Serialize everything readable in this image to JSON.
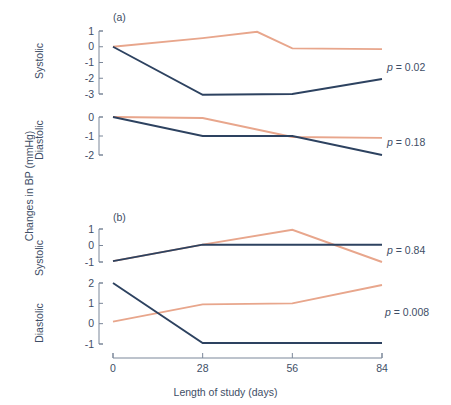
{
  "figure": {
    "ylabel": "Changes in BP (mmHg)",
    "xlabel": "Length of study (days)",
    "panel_a_letter": "(a)",
    "panel_b_letter": "(b)",
    "label_systolic": "Systolic",
    "label_diastolic": "Diastolic"
  },
  "pvalues": {
    "a_systolic": "p = 0.02",
    "a_diastolic": "p = 0.18",
    "b_systolic": "p = 0.84",
    "b_diastolic": "p = 0.008"
  },
  "colors": {
    "dark": "#2d4260",
    "light": "#e8a68c",
    "axis": "#7b8799",
    "text": "#3e4e66"
  },
  "xticks": [
    "0",
    "28",
    "56",
    "84"
  ],
  "xtickvalues": [
    0,
    28,
    56,
    84
  ],
  "chart_data": [
    {
      "type": "line",
      "title": "(a) Systolic",
      "panel": "a",
      "measure": "Systolic",
      "xlabel": "Length of study (days)",
      "ylabel": "Changes in BP (mmHg)",
      "x": [
        0,
        28,
        56,
        84
      ],
      "xticks": [
        "0",
        "28",
        "56",
        "84"
      ],
      "yticks": [
        "1",
        "0",
        "-1",
        "-2",
        "-3"
      ],
      "ytickvalues": [
        1,
        0,
        -1,
        -2,
        -3
      ],
      "ylim": [
        -3,
        1
      ],
      "grid": false,
      "legend": "none",
      "annotation": "p = 0.02",
      "series": [
        {
          "name": "light",
          "color": "#e8a68c",
          "values": [
            0.0,
            0.55,
            0.95,
            -0.1,
            -0.15
          ],
          "x_extended": [
            0,
            28,
            45,
            56,
            84
          ],
          "values_at_x": [
            0.0,
            0.55,
            -0.1,
            -0.15
          ]
        },
        {
          "name": "dark",
          "color": "#2d4260",
          "values": [
            0.0,
            -3.05,
            -3.0,
            -2.05
          ],
          "values_at_x": [
            0.0,
            -3.05,
            -3.0,
            -2.05
          ]
        }
      ]
    },
    {
      "type": "line",
      "title": "(a) Diastolic",
      "panel": "a",
      "measure": "Diastolic",
      "xlabel": "Length of study (days)",
      "ylabel": "Changes in BP (mmHg)",
      "x": [
        0,
        28,
        56,
        84
      ],
      "xticks": [
        "0",
        "28",
        "56",
        "84"
      ],
      "yticks": [
        "0",
        "-1",
        "-2"
      ],
      "ytickvalues": [
        0,
        -1,
        -2
      ],
      "ylim": [
        -2,
        0
      ],
      "grid": false,
      "legend": "none",
      "annotation": "p = 0.18",
      "series": [
        {
          "name": "light",
          "color": "#e8a68c",
          "values_at_x": [
            0.0,
            -0.05,
            -1.05,
            -1.1
          ]
        },
        {
          "name": "dark",
          "color": "#2d4260",
          "values_at_x": [
            0.0,
            -1.0,
            -1.0,
            -2.0
          ]
        }
      ]
    },
    {
      "type": "line",
      "title": "(b) Systolic",
      "panel": "b",
      "measure": "Systolic",
      "xlabel": "Length of study (days)",
      "ylabel": "Changes in BP (mmHg)",
      "x": [
        0,
        28,
        56,
        84
      ],
      "xticks": [
        "0",
        "28",
        "56",
        "84"
      ],
      "yticks": [
        "1",
        "0",
        "-1"
      ],
      "ytickvalues": [
        1,
        0,
        -1
      ],
      "ylim": [
        -1,
        1
      ],
      "grid": false,
      "legend": "none",
      "annotation": "p = 0.84",
      "series": [
        {
          "name": "light",
          "color": "#e8a68c",
          "values_at_x": [
            -0.95,
            0.05,
            0.95,
            -1.0
          ]
        },
        {
          "name": "dark",
          "color": "#2d4260",
          "values_at_x": [
            -0.95,
            0.05,
            0.05,
            0.05
          ]
        }
      ]
    },
    {
      "type": "line",
      "title": "(b) Diastolic",
      "panel": "b",
      "measure": "Diastolic",
      "xlabel": "Length of study (days)",
      "ylabel": "Changes in BP (mmHg)",
      "x": [
        0,
        28,
        56,
        84
      ],
      "xticks": [
        "0",
        "28",
        "56",
        "84"
      ],
      "yticks": [
        "2",
        "1",
        "0",
        "-1"
      ],
      "ytickvalues": [
        2,
        1,
        0,
        -1
      ],
      "ylim": [
        -1,
        2
      ],
      "grid": false,
      "legend": "none",
      "annotation": "p = 0.008",
      "series": [
        {
          "name": "light",
          "color": "#e8a68c",
          "values_at_x": [
            0.1,
            0.95,
            1.0,
            1.9
          ]
        },
        {
          "name": "dark",
          "color": "#2d4260",
          "values_at_x": [
            2.0,
            -0.95,
            -0.95,
            -0.95
          ]
        }
      ]
    }
  ]
}
